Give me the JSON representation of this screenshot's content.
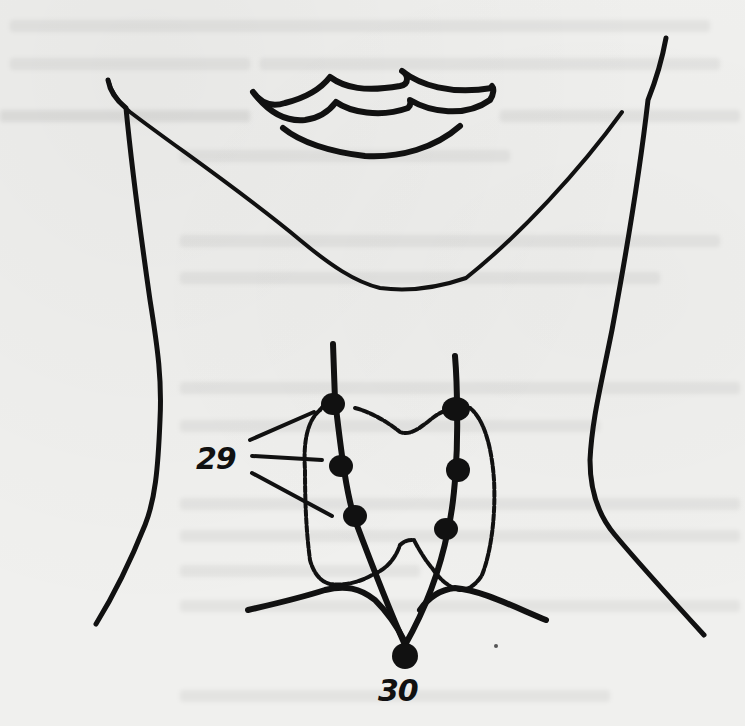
{
  "figure": {
    "colors": {
      "ink": "#111111",
      "paper": "#f0f0ee"
    },
    "labels": [
      {
        "id": "label-29",
        "text": "29",
        "x": 196,
        "y": 444
      },
      {
        "id": "label-30",
        "text": "30",
        "x": 378,
        "y": 676
      }
    ],
    "points": {
      "group_29": [
        {
          "x": 333,
          "y": 402
        },
        {
          "x": 341,
          "y": 466
        },
        {
          "x": 355,
          "y": 516
        }
      ],
      "right_side": [
        {
          "x": 456,
          "y": 407
        },
        {
          "x": 458,
          "y": 468
        },
        {
          "x": 446,
          "y": 529
        }
      ],
      "point_30": {
        "x": 405,
        "y": 655
      }
    }
  }
}
